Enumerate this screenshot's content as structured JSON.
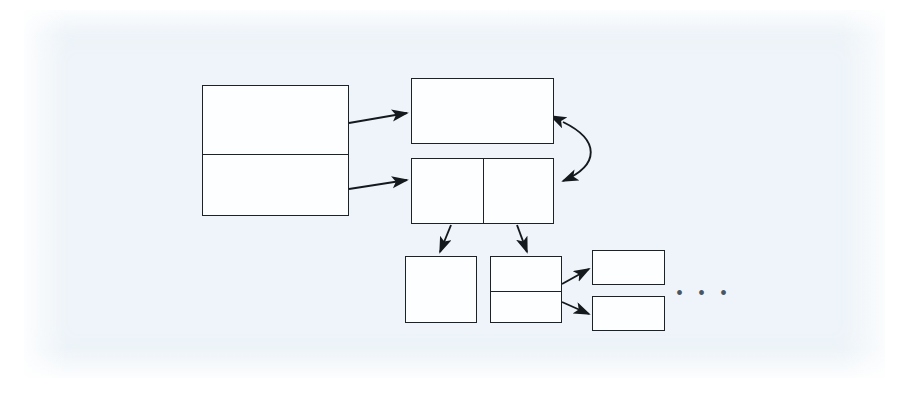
{
  "page": {
    "background_color": "#ffffff",
    "scan_color": "#eef4f9",
    "stroke_color": "#1c2328",
    "node_fill": "#fdfeff",
    "width": 911,
    "height": 403
  },
  "diagram": {
    "type": "block-pointer-diagram",
    "title": "",
    "nodes": [
      {
        "id": "root-table",
        "label": "",
        "x": 202,
        "y": 85,
        "w": 147,
        "h": 131,
        "cells": 2,
        "split": "horizontal",
        "divider_offsets": [
          68
        ]
      },
      {
        "id": "top-block",
        "label": "",
        "x": 411,
        "y": 78,
        "w": 143,
        "h": 66,
        "cells": 1,
        "split": "none",
        "divider_offsets": []
      },
      {
        "id": "index-block",
        "label": "",
        "x": 411,
        "y": 158,
        "w": 143,
        "h": 66,
        "cells": 2,
        "split": "vertical",
        "divider_offsets": [
          71
        ]
      },
      {
        "id": "leaf-a",
        "label": "",
        "x": 405,
        "y": 256,
        "w": 72,
        "h": 67,
        "cells": 1,
        "split": "none",
        "divider_offsets": []
      },
      {
        "id": "leaf-b",
        "label": "",
        "x": 490,
        "y": 256,
        "w": 72,
        "h": 67,
        "cells": 2,
        "split": "horizontal",
        "divider_offsets": [
          34
        ]
      },
      {
        "id": "tail-1",
        "label": "",
        "x": 592,
        "y": 250,
        "w": 73,
        "h": 35,
        "cells": 1,
        "split": "none",
        "divider_offsets": []
      },
      {
        "id": "tail-2",
        "label": "",
        "x": 592,
        "y": 296,
        "w": 73,
        "h": 35,
        "cells": 1,
        "split": "none",
        "divider_offsets": []
      }
    ],
    "edges": [
      {
        "id": "e1",
        "from": "root-table",
        "to": "top-block",
        "label": "",
        "style": "straight",
        "arrow": "single",
        "x1": 349,
        "y1": 123,
        "x2": 409,
        "y2": 113
      },
      {
        "id": "e2",
        "from": "root-table",
        "to": "index-block",
        "label": "",
        "style": "straight",
        "arrow": "single",
        "x1": 349,
        "y1": 189,
        "x2": 409,
        "y2": 180
      },
      {
        "id": "e3",
        "from": "top-block",
        "to": "index-block",
        "label": "",
        "style": "curved",
        "arrow": "double",
        "x1": 561,
        "y1": 120,
        "x2": 561,
        "y2": 183
      },
      {
        "id": "e4",
        "from": "index-block",
        "to": "leaf-a",
        "label": "",
        "style": "straight",
        "arrow": "single",
        "x1": 450,
        "y1": 225,
        "x2": 440,
        "y2": 254
      },
      {
        "id": "e5",
        "from": "index-block",
        "to": "leaf-b",
        "label": "",
        "style": "straight",
        "arrow": "single",
        "x1": 518,
        "y1": 225,
        "x2": 527,
        "y2": 254
      },
      {
        "id": "e6",
        "from": "leaf-b",
        "to": "tail-1",
        "label": "",
        "style": "straight",
        "arrow": "single",
        "x1": 562,
        "y1": 283,
        "x2": 590,
        "y2": 269
      },
      {
        "id": "e7",
        "from": "leaf-b",
        "to": "tail-2",
        "label": "",
        "style": "straight",
        "arrow": "single",
        "x1": 562,
        "y1": 303,
        "x2": 590,
        "y2": 314
      }
    ],
    "annotations": [
      {
        "id": "continuation",
        "type": "ellipsis",
        "text": "• • •",
        "x": 676,
        "y": 283
      }
    ]
  }
}
